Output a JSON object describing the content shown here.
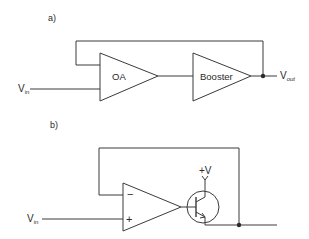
{
  "diagram": {
    "type": "circuit-schematic",
    "part_a": {
      "label": "a)",
      "input": {
        "main": "V",
        "sub": "in"
      },
      "output": {
        "main": "V",
        "sub": "out"
      },
      "blocks": [
        {
          "id": "oa",
          "label": "OA",
          "shape": "triangle"
        },
        {
          "id": "booster",
          "label": "Booster",
          "shape": "triangle"
        }
      ],
      "connections": [
        "Vin -> OA input",
        "OA output -> Booster input",
        "Booster output -> Vout (junction)",
        "Vout junction -> feedback -> OA input"
      ]
    },
    "part_b": {
      "label": "b)",
      "input": {
        "main": "V",
        "sub": "in"
      },
      "opamp": {
        "inverting": "−",
        "non_inverting": "+"
      },
      "transistor": {
        "type": "NPN",
        "supply": "+V"
      },
      "connections": [
        "Vin -> op-amp + input",
        "op-amp output -> transistor base",
        "transistor collector -> +V",
        "transistor emitter -> output (junction)",
        "output junction -> feedback -> op-amp − input"
      ]
    }
  }
}
